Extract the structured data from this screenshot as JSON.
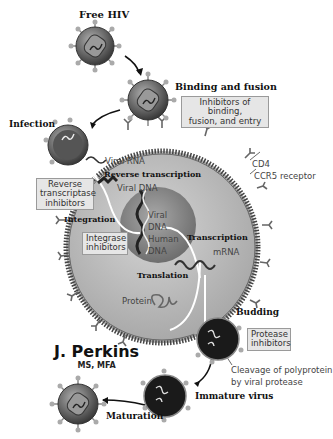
{
  "diagram": {
    "stages": {
      "free_hiv": "Free HIV",
      "binding": "Binding and fusion",
      "infection": "Infection",
      "reverse_transcription": "Reverse transcription",
      "integration": "Integration",
      "transcription": "Transcription",
      "translation": "Translation",
      "budding": "Budding",
      "immature": "Immature virus",
      "maturation": "Maturation"
    },
    "molecules": {
      "viral_rna": "Viral RNA",
      "viral_dna": "Viral DNA",
      "viral_dna_nucleus_1": "Viral",
      "viral_dna_nucleus_2": "DNA",
      "human_dna_1": "Human",
      "human_dna_2": "DNA",
      "mrna": "mRNA",
      "protein": "Protein",
      "cd4": "CD4",
      "ccr5": "CCR5 receptor",
      "cleavage_1": "Cleavage of polyprotein",
      "cleavage_2": "by viral protease"
    },
    "inhibitors": {
      "entry_1": "Inhibitors of binding,",
      "entry_2": "fusion, and entry",
      "rt_1": "Reverse",
      "rt_2": "transcriptase",
      "rt_3": "inhibitors",
      "integrase_1": "Integrase",
      "integrase_2": "inhibitors",
      "protease_1": "Protease",
      "protease_2": "inhibitors"
    },
    "signature": {
      "name": "J. Perkins",
      "degrees": "MS, MFA"
    },
    "colors": {
      "cell": "#bdbdbd",
      "nucleus": "#8f8f8f",
      "virus": "#7a7a7a",
      "immature": "#1a1a1a",
      "box": "#e6e6e6"
    }
  }
}
